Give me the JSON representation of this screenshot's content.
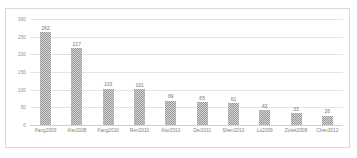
{
  "chart_data": {
    "type": "bar",
    "title": "",
    "xlabel": "",
    "ylabel": "",
    "ylim": [
      0,
      300
    ],
    "yticks": [
      300,
      250,
      200,
      150,
      100,
      50,
      0
    ],
    "grid": true,
    "legend": "none",
    "bar_color": "#9b9b9b",
    "categories": [
      "Fang2009",
      "Aler2008",
      "Fang2010",
      "Ren2010",
      "Aior2010",
      "Der2011",
      "Shen2010",
      "Lo2009",
      "Zolek2008",
      "Chen2012"
    ],
    "values": [
      262,
      217,
      103,
      101,
      69,
      65,
      61,
      42,
      33,
      26
    ]
  }
}
